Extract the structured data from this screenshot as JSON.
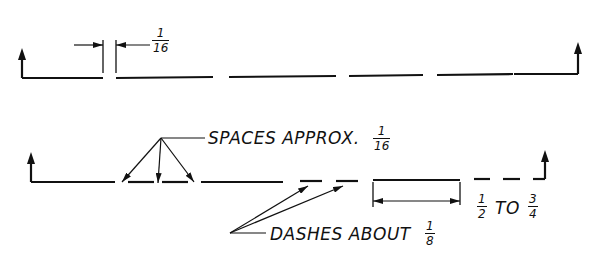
{
  "diagram": {
    "colors": {
      "ink": "#111111",
      "background": "#ffffff"
    },
    "top_line": {
      "gap_dimension": {
        "numerator": "1",
        "denominator": "16"
      }
    },
    "bottom_line": {
      "spaces_label": "SPACES APPROX.",
      "spaces_fraction": {
        "numerator": "1",
        "denominator": "16"
      },
      "dashes_label": "DASHES ABOUT",
      "dashes_fraction": {
        "numerator": "1",
        "denominator": "8"
      },
      "length_range": {
        "from": {
          "numerator": "1",
          "denominator": "2"
        },
        "to_word": "TO",
        "to": {
          "numerator": "3",
          "denominator": "4"
        }
      }
    }
  }
}
